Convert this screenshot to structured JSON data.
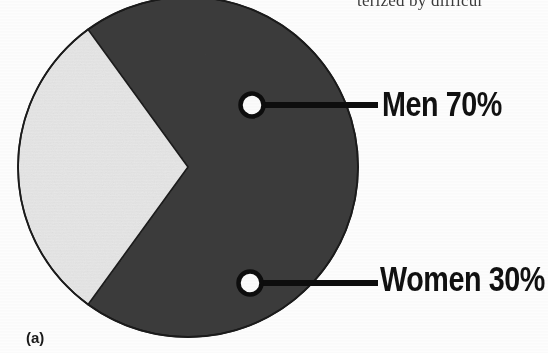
{
  "figure": {
    "caption": "(a)",
    "page_text_fragment": "terized by difficul"
  },
  "legend": {
    "men": "Men 70%",
    "women": "Women 30%"
  },
  "colors": {
    "background": "#fdfdfd",
    "men_slice": "#3c3c3c",
    "women_slice": "#e7e7e7",
    "outline": "#141414",
    "marker_fill": "#fbfbfb",
    "text": "#111111"
  },
  "chart_data": {
    "type": "pie",
    "title": "",
    "labels": [
      "Men",
      "Women"
    ],
    "values": [
      70,
      30
    ],
    "value_unit": "%",
    "data_labels": [
      "Men 70%",
      "Women 30%"
    ],
    "slice_colors": [
      "#3c3c3c",
      "#e7e7e7"
    ],
    "legend_position": "right-callout",
    "grid": false,
    "start_angle_deg": 126,
    "direction": "clockwise"
  }
}
